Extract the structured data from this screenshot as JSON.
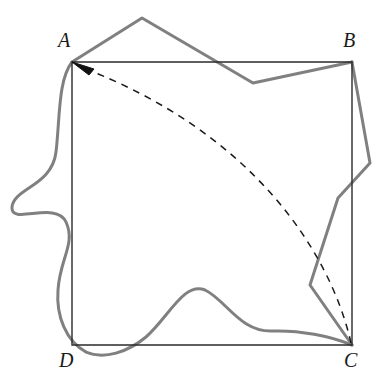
{
  "figure": {
    "kind": "geometry-diagram",
    "width": 382,
    "height": 383,
    "background_color": "#ffffff"
  },
  "labels": {
    "a": "A",
    "b": "B",
    "c": "C",
    "d": "D"
  },
  "colors": {
    "square_stroke": "#2b2b2b",
    "curve_stroke": "#808080",
    "dashed_stroke": "#1a1a1a",
    "arrow_fill": "#111111",
    "background": "#ffffff"
  },
  "strokes": {
    "square_width": 1.4,
    "curve_width": 3.0,
    "dashed_width": 1.5,
    "dash_pattern": "7 6"
  },
  "square": {
    "name": "ABCD",
    "vertices": [
      {
        "name": "A",
        "x": 72,
        "y": 62
      },
      {
        "name": "B",
        "x": 352,
        "y": 62
      },
      {
        "name": "C",
        "x": 352,
        "y": 345
      },
      {
        "name": "D",
        "x": 72,
        "y": 345
      }
    ],
    "path": "M 72 62 L 352 62 L 352 345 L 72 345 Z"
  },
  "dashed_arc": {
    "from": "C",
    "to": "A",
    "bows_toward": "upper-right",
    "path": "M 351 343 C 330 250 250 130 78 66",
    "arrowhead_at": "A",
    "arrowhead_path": "M 72 62 L 92 68 L 88 73 Z"
  },
  "closed_curve": {
    "style": "closed deformed loop around the square, partly angular and partly smooth",
    "segments": [
      {
        "name": "top-polyline",
        "type": "angular",
        "points": "72,62 142,18 253,83 352,62",
        "notes": "rises to a peak above AB then dips below AB before reaching B"
      },
      {
        "name": "right-polyline",
        "type": "angular",
        "points": "352,62 370,163 338,198 310,285 352,345",
        "notes": "bulges right of BC, crosses it, notches left, then runs down to C"
      },
      {
        "name": "bottom-smooth",
        "type": "smooth",
        "path": "M 352 345 C 330 336 300 330 272 331 C 240 332 226 300 205 290 C 184 281 168 318 146 337 C 128 352 104 360 86 352",
        "notes": "a gaussian-like bump above DC, then dips below DC near D"
      },
      {
        "name": "left-smooth",
        "type": "smooth",
        "path": "M 86 352 C 66 341 56 316 58 290 C 60 258 76 244 66 222 C 56 200 10 226 12 207 C 14 188 52 186 56 152 C 60 118 58 80 72 62",
        "notes": "loops around D, then S-curves out to the left and returns to A"
      }
    ]
  }
}
